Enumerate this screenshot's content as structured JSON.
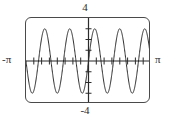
{
  "figure": {
    "type": "graphing-calculator-plot",
    "frame": {
      "border_color": "#4a4a4a",
      "background": "#ffffff",
      "corner_radius_px": 6
    },
    "labels": {
      "y_max": "4",
      "y_min": "-4",
      "x_min": "-π",
      "x_max": "π"
    }
  },
  "chart_data": {
    "type": "line",
    "title": "",
    "xlabel": "",
    "ylabel": "",
    "xlim": [
      -3.14159265,
      3.14159265
    ],
    "ylim": [
      -4,
      4
    ],
    "xtick_labels": [
      "-π",
      "π"
    ],
    "ytick_labels": [
      "-4",
      "4"
    ],
    "grid": false,
    "legend": null,
    "axes": {
      "x_axis_visible": true,
      "y_axis_visible": true,
      "x_tick_spacing": 0.39269908,
      "y_tick_spacing": 1
    },
    "series": [
      {
        "name": "y = 3 sin(5x)",
        "function": "3*sin(5*x)",
        "amplitude": 3,
        "frequency_cycles_over_domain": 5,
        "color": "#2b2b2b",
        "line_width": 1,
        "x": [
          -3.14159265,
          -2.98451302,
          -2.82743339,
          -2.67035376,
          -2.51327412,
          -2.35619449,
          -2.19911486,
          -2.04203522,
          -1.88495559,
          -1.72787596,
          -1.57079633,
          -1.41371669,
          -1.25663706,
          -1.09955743,
          -0.9424778,
          -0.78539816,
          -0.62831853,
          -0.4712389,
          -0.31415927,
          -0.15707963,
          0,
          0.15707963,
          0.31415927,
          0.4712389,
          0.62831853,
          0.78539816,
          0.9424778,
          1.09955743,
          1.25663706,
          1.41371669,
          1.57079633,
          1.72787596,
          1.88495559,
          2.04203522,
          2.19911486,
          2.35619449,
          2.51327412,
          2.67035376,
          2.82743339,
          2.98451302,
          3.14159265
        ],
        "y": [
          0,
          -2.12,
          -3,
          -2.12,
          0,
          2.12,
          3,
          2.12,
          0,
          -2.12,
          -3,
          -2.12,
          0,
          2.12,
          3,
          2.12,
          0,
          -2.12,
          -3,
          -2.12,
          0,
          2.12,
          3,
          2.12,
          0,
          -2.12,
          -3,
          -2.12,
          0,
          2.12,
          3,
          2.12,
          0,
          -2.12,
          -3,
          -2.12,
          0,
          2.12,
          3,
          2.12,
          0
        ]
      }
    ]
  }
}
